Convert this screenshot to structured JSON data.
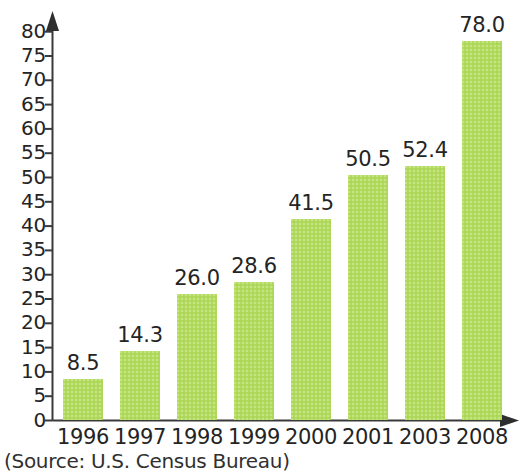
{
  "chart_data": {
    "type": "bar",
    "title": "",
    "subtitle": "",
    "xlabel": "",
    "ylabel": "",
    "categories": [
      "1996",
      "1997",
      "1998",
      "1999",
      "2000",
      "2001",
      "2003",
      "2008"
    ],
    "values": [
      8.5,
      14.3,
      26.0,
      28.6,
      41.5,
      50.5,
      52.4,
      78.0
    ],
    "value_labels": [
      "8.5",
      "14.3",
      "26.0",
      "28.6",
      "41.5",
      "50.5",
      "52.4",
      "78.0"
    ],
    "ylim": [
      0,
      80
    ],
    "ytick_step": 5,
    "ytick_labels": [
      "0",
      "5",
      "10",
      "15",
      "20",
      "25",
      "30",
      "35",
      "40",
      "45",
      "50",
      "55",
      "60",
      "65",
      "70",
      "75",
      "80"
    ],
    "ytick_values": [
      0,
      5,
      10,
      15,
      20,
      25,
      30,
      35,
      40,
      45,
      50,
      55,
      60,
      65,
      70,
      75,
      80
    ],
    "grid": false,
    "legend": null,
    "legend_position": "none",
    "bar_color": "#b2db5e",
    "axis_color": "#3a3a3a",
    "text_color": "#242424",
    "background_color": "#ffffff",
    "y_axis_arrow": true,
    "x_axis_arrow": true,
    "annotations": []
  },
  "source": {
    "note": "(Source: U.S. Census Bureau)"
  }
}
